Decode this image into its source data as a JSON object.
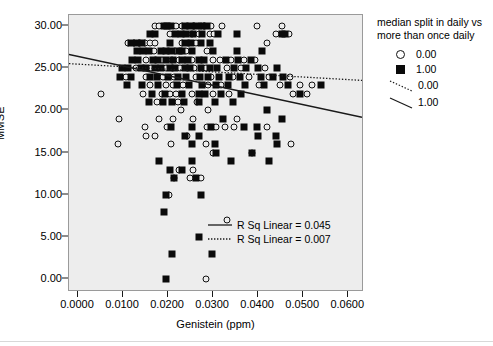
{
  "chart": {
    "title": "",
    "xlabel": "Genistein (ppm)",
    "ylabel": "MMSE",
    "background_color": "#ededed",
    "page_background": "#ffffff"
  },
  "legend": {
    "title": "median split in daily vs more than once daily",
    "marker_entries": [
      {
        "label": "0.00",
        "icon": "open-circle-marker"
      },
      {
        "label": "1.00",
        "icon": "filled-square-marker"
      }
    ],
    "line_entries": [
      {
        "label": "0.00",
        "icon": "dotted-line-swatch",
        "style": "dotted"
      },
      {
        "label": "1.00",
        "icon": "solid-line-swatch",
        "style": "solid"
      }
    ]
  },
  "annotations": [
    {
      "label": "R Sq Linear = 0.045",
      "style": "solid"
    },
    {
      "label": "R Sq Linear = 0.007",
      "style": "dotted"
    }
  ],
  "axes": {
    "x_ticks": [
      "0.0000",
      "0.0100",
      "0.0200",
      "0.0300",
      "0.0400",
      "0.0500",
      "0.0600"
    ],
    "y_ticks": [
      "0.00",
      "5.00",
      "10.00",
      "15.00",
      "20.00",
      "25.00",
      "30.00"
    ]
  },
  "chart_data": {
    "type": "scatter",
    "title": "",
    "xlabel": "Genistein (ppm)",
    "ylabel": "MMSE",
    "xlim": [
      -0.002,
      0.0635
    ],
    "ylim": [
      -1.5,
      31.3
    ],
    "xticks": [
      0.0,
      0.01,
      0.02,
      0.03,
      0.04,
      0.05,
      0.06
    ],
    "xticklabels": [
      "0.0000",
      "0.0100",
      "0.0200",
      "0.0300",
      "0.0400",
      "0.0500",
      "0.0600"
    ],
    "yticks": [
      0,
      5,
      10,
      15,
      20,
      25,
      30
    ],
    "yticklabels": [
      "0.00",
      "5.00",
      "10.00",
      "15.00",
      "20.00",
      "25.00",
      "30.00"
    ],
    "grid": false,
    "legend_position": "right-outside",
    "legend_title": "median split in daily vs more than once daily",
    "series": [
      {
        "name": "0.00",
        "marker": "open-circle",
        "color": "#111111",
        "points": [
          [
            0.0172,
            30
          ],
          [
            0.018,
            30
          ],
          [
            0.0218,
            30
          ],
          [
            0.0232,
            30
          ],
          [
            0.0243,
            30
          ],
          [
            0.0258,
            30
          ],
          [
            0.0272,
            30
          ],
          [
            0.028,
            30
          ],
          [
            0.0295,
            30
          ],
          [
            0.032,
            30
          ],
          [
            0.0398,
            30
          ],
          [
            0.0452,
            30
          ],
          [
            0.0205,
            29
          ],
          [
            0.0252,
            29
          ],
          [
            0.0268,
            29
          ],
          [
            0.0292,
            29
          ],
          [
            0.0302,
            29
          ],
          [
            0.044,
            29
          ],
          [
            0.0468,
            29
          ],
          [
            0.011,
            28
          ],
          [
            0.0124,
            28
          ],
          [
            0.0136,
            28
          ],
          [
            0.0148,
            28
          ],
          [
            0.016,
            28
          ],
          [
            0.0172,
            28
          ],
          [
            0.023,
            28
          ],
          [
            0.0246,
            28
          ],
          [
            0.0262,
            28
          ],
          [
            0.042,
            28
          ],
          [
            0.0168,
            27
          ],
          [
            0.02,
            27
          ],
          [
            0.0216,
            27
          ],
          [
            0.024,
            27
          ],
          [
            0.0286,
            27
          ],
          [
            0.0152,
            26
          ],
          [
            0.0186,
            26
          ],
          [
            0.0208,
            26
          ],
          [
            0.0224,
            26
          ],
          [
            0.0252,
            26
          ],
          [
            0.03,
            26
          ],
          [
            0.0316,
            26
          ],
          [
            0.034,
            26
          ],
          [
            0.0368,
            26
          ],
          [
            0.0392,
            26
          ],
          [
            0.0128,
            25
          ],
          [
            0.0162,
            25
          ],
          [
            0.0196,
            25
          ],
          [
            0.0226,
            25
          ],
          [
            0.0258,
            25
          ],
          [
            0.0284,
            25
          ],
          [
            0.033,
            25
          ],
          [
            0.0362,
            25
          ],
          [
            0.0416,
            25
          ],
          [
            0.0106,
            24
          ],
          [
            0.015,
            24
          ],
          [
            0.0188,
            24
          ],
          [
            0.0214,
            24
          ],
          [
            0.0262,
            24
          ],
          [
            0.0296,
            24
          ],
          [
            0.0344,
            24
          ],
          [
            0.038,
            24
          ],
          [
            0.0424,
            24
          ],
          [
            0.047,
            24
          ],
          [
            0.016,
            23
          ],
          [
            0.0196,
            23
          ],
          [
            0.021,
            23
          ],
          [
            0.0234,
            23
          ],
          [
            0.0288,
            23
          ],
          [
            0.0318,
            23
          ],
          [
            0.0402,
            23
          ],
          [
            0.0448,
            23
          ],
          [
            0.0492,
            23
          ],
          [
            0.052,
            23
          ],
          [
            0.0052,
            22
          ],
          [
            0.0144,
            22
          ],
          [
            0.0186,
            22
          ],
          [
            0.0204,
            22
          ],
          [
            0.0218,
            22
          ],
          [
            0.0252,
            22
          ],
          [
            0.03,
            22
          ],
          [
            0.0336,
            22
          ],
          [
            0.0478,
            22
          ],
          [
            0.0508,
            22
          ],
          [
            0.0176,
            21
          ],
          [
            0.0222,
            21
          ],
          [
            0.0264,
            21
          ],
          [
            0.0228,
            20
          ],
          [
            0.0288,
            20
          ],
          [
            0.009,
            19
          ],
          [
            0.018,
            19
          ],
          [
            0.0212,
            19
          ],
          [
            0.0256,
            19
          ],
          [
            0.0352,
            19
          ],
          [
            0.0148,
            18
          ],
          [
            0.0198,
            18
          ],
          [
            0.0286,
            18
          ],
          [
            0.0306,
            18
          ],
          [
            0.0326,
            18
          ],
          [
            0.0346,
            18
          ],
          [
            0.042,
            18
          ],
          [
            0.0152,
            17
          ],
          [
            0.017,
            17
          ],
          [
            0.0242,
            17
          ],
          [
            0.0088,
            16
          ],
          [
            0.0206,
            16
          ],
          [
            0.0284,
            16
          ],
          [
            0.0472,
            16
          ],
          [
            0.03,
            15
          ],
          [
            0.0386,
            15
          ],
          [
            0.0224,
            13
          ],
          [
            0.0256,
            13
          ],
          [
            0.0214,
            12
          ],
          [
            0.0248,
            12
          ],
          [
            0.0272,
            12
          ],
          [
            0.0202,
            10
          ],
          [
            0.033,
            7
          ],
          [
            0.0284,
            0
          ]
        ]
      },
      {
        "name": "1.00",
        "marker": "filled-square",
        "color": "#0a0a0a",
        "points": [
          [
            0.019,
            30
          ],
          [
            0.0198,
            30
          ],
          [
            0.0206,
            30
          ],
          [
            0.0238,
            30
          ],
          [
            0.025,
            30
          ],
          [
            0.0262,
            30
          ],
          [
            0.0276,
            30
          ],
          [
            0.0286,
            30
          ],
          [
            0.016,
            29
          ],
          [
            0.0172,
            29
          ],
          [
            0.0216,
            29
          ],
          [
            0.0228,
            29
          ],
          [
            0.024,
            29
          ],
          [
            0.0256,
            29
          ],
          [
            0.0276,
            29
          ],
          [
            0.031,
            29
          ],
          [
            0.0352,
            29
          ],
          [
            0.0452,
            29
          ],
          [
            0.046,
            29
          ],
          [
            0.0118,
            28
          ],
          [
            0.013,
            28
          ],
          [
            0.0142,
            28
          ],
          [
            0.0204,
            28
          ],
          [
            0.0238,
            28
          ],
          [
            0.025,
            28
          ],
          [
            0.0274,
            28
          ],
          [
            0.0292,
            28
          ],
          [
            0.013,
            27
          ],
          [
            0.0144,
            27
          ],
          [
            0.0158,
            27
          ],
          [
            0.0184,
            27
          ],
          [
            0.0196,
            27
          ],
          [
            0.0208,
            27
          ],
          [
            0.0224,
            27
          ],
          [
            0.0232,
            27
          ],
          [
            0.0254,
            27
          ],
          [
            0.03,
            27
          ],
          [
            0.0352,
            27
          ],
          [
            0.0408,
            27
          ],
          [
            0.012,
            26
          ],
          [
            0.0134,
            26
          ],
          [
            0.0166,
            26
          ],
          [
            0.0178,
            26
          ],
          [
            0.0196,
            26
          ],
          [
            0.0212,
            26
          ],
          [
            0.0232,
            26
          ],
          [
            0.0244,
            26
          ],
          [
            0.0268,
            26
          ],
          [
            0.028,
            26
          ],
          [
            0.0328,
            26
          ],
          [
            0.0356,
            26
          ],
          [
            0.0384,
            26
          ],
          [
            0.0098,
            25
          ],
          [
            0.0112,
            25
          ],
          [
            0.014,
            25
          ],
          [
            0.0152,
            25
          ],
          [
            0.0172,
            25
          ],
          [
            0.0184,
            25
          ],
          [
            0.0204,
            25
          ],
          [
            0.0216,
            25
          ],
          [
            0.0238,
            25
          ],
          [
            0.0248,
            25
          ],
          [
            0.0272,
            25
          ],
          [
            0.0292,
            25
          ],
          [
            0.0308,
            25
          ],
          [
            0.0346,
            25
          ],
          [
            0.0372,
            25
          ],
          [
            0.04,
            25
          ],
          [
            0.0442,
            25
          ],
          [
            0.0094,
            24
          ],
          [
            0.0118,
            24
          ],
          [
            0.016,
            24
          ],
          [
            0.0176,
            24
          ],
          [
            0.02,
            24
          ],
          [
            0.0222,
            24
          ],
          [
            0.024,
            24
          ],
          [
            0.027,
            24
          ],
          [
            0.0288,
            24
          ],
          [
            0.0312,
            24
          ],
          [
            0.0336,
            24
          ],
          [
            0.036,
            24
          ],
          [
            0.0406,
            24
          ],
          [
            0.0434,
            24
          ],
          [
            0.0456,
            24
          ],
          [
            0.0108,
            23
          ],
          [
            0.0142,
            23
          ],
          [
            0.0178,
            23
          ],
          [
            0.022,
            23
          ],
          [
            0.0246,
            23
          ],
          [
            0.0276,
            23
          ],
          [
            0.0306,
            23
          ],
          [
            0.0332,
            23
          ],
          [
            0.037,
            23
          ],
          [
            0.0412,
            23
          ],
          [
            0.0466,
            23
          ],
          [
            0.054,
            23
          ],
          [
            0.0164,
            22
          ],
          [
            0.0194,
            22
          ],
          [
            0.0232,
            22
          ],
          [
            0.0268,
            22
          ],
          [
            0.0282,
            22
          ],
          [
            0.0318,
            22
          ],
          [
            0.0362,
            22
          ],
          [
            0.0494,
            22
          ],
          [
            0.0158,
            21
          ],
          [
            0.0188,
            21
          ],
          [
            0.0208,
            21
          ],
          [
            0.0236,
            21
          ],
          [
            0.0268,
            21
          ],
          [
            0.0304,
            21
          ],
          [
            0.0344,
            21
          ],
          [
            0.042,
            20
          ],
          [
            0.0322,
            19
          ],
          [
            0.0452,
            19
          ],
          [
            0.0206,
            18
          ],
          [
            0.0254,
            18
          ],
          [
            0.0296,
            18
          ],
          [
            0.0368,
            18
          ],
          [
            0.0398,
            18
          ],
          [
            0.0238,
            17
          ],
          [
            0.0268,
            17
          ],
          [
            0.04,
            17
          ],
          [
            0.044,
            17
          ],
          [
            0.0252,
            16
          ],
          [
            0.0304,
            16
          ],
          [
            0.0442,
            16
          ],
          [
            0.0306,
            15
          ],
          [
            0.0386,
            15
          ],
          [
            0.018,
            14
          ],
          [
            0.0252,
            14
          ],
          [
            0.034,
            14
          ],
          [
            0.0424,
            14
          ],
          [
            0.0204,
            13
          ],
          [
            0.023,
            13
          ],
          [
            0.0214,
            12
          ],
          [
            0.0262,
            12
          ],
          [
            0.0196,
            10
          ],
          [
            0.0274,
            10
          ],
          [
            0.0192,
            8
          ],
          [
            0.0268,
            5
          ],
          [
            0.0208,
            3
          ],
          [
            0.0298,
            3
          ],
          [
            0.0195,
            0
          ]
        ]
      }
    ],
    "fit_lines": [
      {
        "name": "1.00",
        "style": "solid",
        "r_sq_linear": 0.045,
        "label": "R Sq Linear = 0.045",
        "x_start": -0.002,
        "y_start": 26.6,
        "x_end": 0.0635,
        "y_end": 19.1
      },
      {
        "name": "0.00",
        "style": "dotted",
        "r_sq_linear": 0.007,
        "label": "R Sq Linear = 0.007",
        "x_start": -0.002,
        "y_start": 25.5,
        "x_end": 0.0635,
        "y_end": 23.5
      }
    ]
  }
}
